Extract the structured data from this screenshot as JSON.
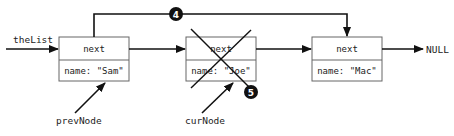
{
  "diagram": {
    "head_label": "theList",
    "null_label": "NULL",
    "nodes": [
      {
        "id": "sam",
        "field_top": "next",
        "field_bottom": "name: \"Sam\"",
        "pointer_label": "prevNode",
        "deleted": false
      },
      {
        "id": "joe",
        "field_top": "next",
        "field_bottom": "name: \"Joe\"",
        "pointer_label": "curNode",
        "deleted": true
      },
      {
        "id": "mac",
        "field_top": "next",
        "field_bottom": "name: \"Mac\"",
        "pointer_label": "",
        "deleted": false
      }
    ],
    "steps": [
      {
        "number": "4",
        "description": "prevNode next bypasses curNode to Mac"
      },
      {
        "number": "5",
        "description": "curNode deleted"
      }
    ],
    "colors": {
      "line": "#111111",
      "box": "#555555",
      "badge": "#111111"
    }
  }
}
